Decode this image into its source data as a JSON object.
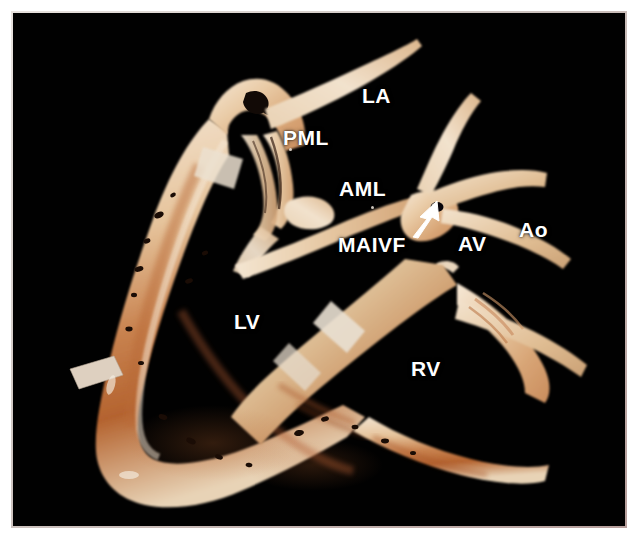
{
  "figure": {
    "kind": "gross-pathology-photograph",
    "background_color": "#010101",
    "border_color": "#c9bdb8",
    "label_color": "#ffffff"
  },
  "labels": [
    {
      "id": "la",
      "text": "LA",
      "x": 362,
      "y": 85,
      "size": 21,
      "name": "label-left-atrium"
    },
    {
      "id": "pml",
      "text": "PML",
      "x": 283,
      "y": 127,
      "size": 21,
      "name": "label-posterior-mitral-leaflet"
    },
    {
      "id": "aml",
      "text": "AML",
      "x": 339,
      "y": 178,
      "size": 21,
      "name": "label-anterior-mitral-leaflet"
    },
    {
      "id": "maivf",
      "text": "MAIVF",
      "x": 338,
      "y": 234,
      "size": 21,
      "name": "label-mitral-aortic-intervalvular-fibrosa"
    },
    {
      "id": "av",
      "text": "AV",
      "x": 458,
      "y": 233,
      "size": 21,
      "name": "label-aortic-valve"
    },
    {
      "id": "ao",
      "text": "Ao",
      "x": 519,
      "y": 219,
      "size": 21,
      "name": "label-aorta"
    },
    {
      "id": "lv",
      "text": "LV",
      "x": 234,
      "y": 311,
      "size": 21,
      "name": "label-left-ventricle"
    },
    {
      "id": "rv",
      "text": "RV",
      "x": 411,
      "y": 358,
      "size": 21,
      "name": "label-right-ventricle"
    }
  ],
  "markers": {
    "dots": [
      {
        "id": "dot-pml",
        "x": 289,
        "y": 148
      },
      {
        "id": "dot-aml",
        "x": 371,
        "y": 206
      }
    ],
    "arrow": {
      "id": "maivf-arrow",
      "points_to": "mitral-aortic intervalvular fibrosa",
      "color": "#ffffff"
    }
  },
  "palette": {
    "tissue_pale": "#efd9bf",
    "tissue_mid": "#e3bd96",
    "tissue_warm": "#d29a6a",
    "tissue_red": "#b05a33",
    "tissue_dark": "#6d2f17",
    "tissue_highlight": "#f7ece0",
    "cavity_black": "#010101"
  }
}
